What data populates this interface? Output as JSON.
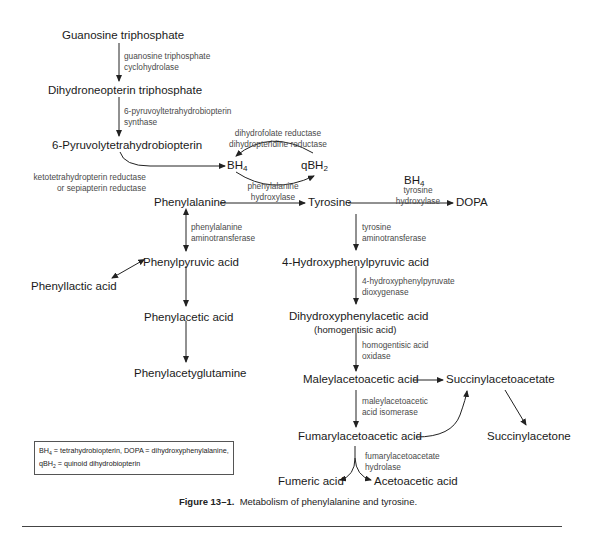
{
  "diagram": {
    "title": "Metabolism of phenylalanine and tyrosine",
    "nodes": {
      "gtp": "Guanosine triphosphate",
      "dntp": "Dihydroneopterin triphosphate",
      "pyruvoyl": "6-Pyruvolytetrahydrobiopterin",
      "bh4": "BH",
      "bh4_sub": "4",
      "qbh2": "qBH",
      "qbh2_sub": "2",
      "bh4_tyr": "BH",
      "bh4_tyr_sub": "4",
      "phe": "Phenylalanine",
      "tyr": "Tyrosine",
      "dopa": "DOPA",
      "phenylpyruvic": "Phenylpyruvic acid",
      "phenyllactic": "Phenyllactic acid",
      "phenylacetic": "Phenylacetic acid",
      "phenylacetylgln": "Phenylacetyglutamine",
      "hppa": "4-Hydroxyphenylpyruvic acid",
      "dhpa": "Dihydroxyphenylacetic acid",
      "dhpa_alt": "(homogentisic acid)",
      "maa": "Maleylacetoacetic acid",
      "saa": "Succinylacetoacetate",
      "faa": "Fumarylacetoacetic acid",
      "succinylacetone": "Succinylacetone",
      "fumaric": "Fumeric acid",
      "acetoacetic": "Acetoacetic acid"
    },
    "enzymes": {
      "gtp_cyclo_1": "guanosine triphosphate",
      "gtp_cyclo_2": "cyclohydrolase",
      "ptps_1": "6-pyruvoyltetrahydrobiopterin",
      "ptps_2": "synthase",
      "dhfr_1": "dihydrofolate reductase",
      "dhfr_2": "dihydropteridine reductase",
      "kr_1": "ketotetrahydropterin reductase",
      "kr_2": "or sepiapterin reductase",
      "pah_1": "phenylalanine",
      "pah_2": "hydroxylase",
      "th_1": "tyrosine",
      "th_2": "hydroxylase",
      "pat_1": "phenylalanine",
      "pat_2": "aminotransferase",
      "tat_1": "tyrosine",
      "tat_2": "aminotransferase",
      "hppd_1": "4-hydroxyphenylpyruvate",
      "hppd_2": "dioxygenase",
      "hgo_1": "homogentisic acid",
      "hgo_2": "oxidase",
      "mai_1": "maleylacetoacetic",
      "mai_2": "acid isomerase",
      "fah_1": "fumarylacetoacetate",
      "fah_2": "hydrolase"
    }
  },
  "legend": {
    "line1_a": "BH",
    "line1_sub": "4",
    "line1_b": " = tetrahydrobiopterin, DOPA = dihydroxyphenylalanine,",
    "line2_a": "qBH",
    "line2_sub": "2",
    "line2_b": " = quinoid dihydrobiopterin"
  },
  "caption": {
    "label": "Figure 13–1.",
    "text": "  Metabolism of phenylalanine and tyrosine."
  }
}
